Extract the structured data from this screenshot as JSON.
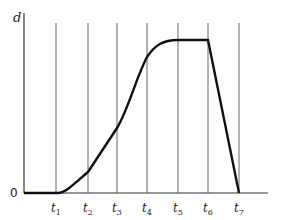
{
  "chart_data": {
    "type": "line",
    "title": "",
    "xlabel": "",
    "ylabel": "d",
    "y_origin_label": "0",
    "categories": [
      "0",
      "t1",
      "t2",
      "t3",
      "t4",
      "t5",
      "t6",
      "t7"
    ],
    "x_ticks": [
      {
        "name": "t",
        "sub": "1"
      },
      {
        "name": "t",
        "sub": "2"
      },
      {
        "name": "t",
        "sub": "3"
      },
      {
        "name": "t",
        "sub": "4"
      },
      {
        "name": "t",
        "sub": "5"
      },
      {
        "name": "t",
        "sub": "6"
      },
      {
        "name": "t",
        "sub": "7"
      }
    ],
    "series": [
      {
        "name": "d",
        "x": [
          "0",
          "t1",
          "t2",
          "t3",
          "t4",
          "t5",
          "t6",
          "t7"
        ],
        "values": [
          0,
          0,
          0.14,
          0.42,
          0.89,
          1.0,
          1.0,
          0
        ]
      }
    ],
    "ylim": [
      0,
      1.1
    ],
    "grid": "vertical lines at each t",
    "legend": "none"
  },
  "colors": {
    "curve": "#111111",
    "gridlines": "#555555",
    "axis": "#333333"
  }
}
